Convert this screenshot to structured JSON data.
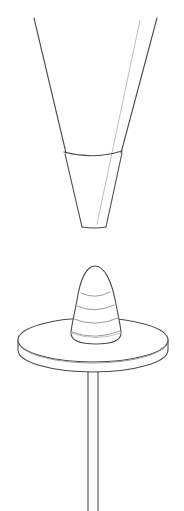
{
  "page": {
    "title": "Technical Line Drawing",
    "width": 184,
    "height": 511,
    "background_color": "#ffffff",
    "style": "monochrome outline illustration, no text labels"
  },
  "palette": {
    "background": "#ffffff",
    "outline_dark": "#4a4a4a",
    "outline_mid": "#9a9a9a",
    "outline_faint": "#c0c0c0"
  },
  "figures": [
    {
      "id": "funnel",
      "name": "open-funnel",
      "description": "Tall open funnel / conical nozzle shown from the side, open at the top and truncated flat at the bottom",
      "position": "upper half of canvas",
      "bounds": {
        "x": 33,
        "y": 17,
        "width": 125,
        "height": 212
      },
      "parts": [
        {
          "name": "left-wall",
          "from": [
            34,
            18
          ],
          "to": [
            82,
            227
          ]
        },
        {
          "name": "right-wall",
          "from": [
            157,
            18
          ],
          "to": [
            105,
            227
          ]
        },
        {
          "name": "rim-line",
          "description": "elliptical seam dividing upper cone from lower spout",
          "y": 153,
          "x_start": 64,
          "x_end": 122
        },
        {
          "name": "bottom-opening",
          "description": "flat truncated tip",
          "y": 227,
          "x_start": 82,
          "x_end": 105
        },
        {
          "name": "interior-edge",
          "description": "faint far-side wall line",
          "from": [
            140,
            20
          ],
          "to": [
            97,
            224
          ]
        }
      ]
    },
    {
      "id": "pedestal",
      "name": "cone-on-pedestal-table",
      "description": "Rounded bullet-shaped cone with ridge bands resting on a round disc table supported by a thin central stem",
      "position": "lower half of canvas",
      "bounds": {
        "x": 18,
        "y": 265,
        "width": 150,
        "height": 246
      },
      "parts": [
        {
          "name": "ridged-cone",
          "description": "beehive / bullet shaped cone with four curved ridge arcs",
          "apex": [
            95,
            266
          ],
          "base_y": 334,
          "base_x_start": 72,
          "base_x_end": 120,
          "ridge_count": 4
        },
        {
          "name": "table-top-disc",
          "description": "flat elliptical disc seen in perspective",
          "center": [
            93,
            340
          ],
          "radius_x": 75,
          "radius_y": 22,
          "thickness": 12
        },
        {
          "name": "stem",
          "description": "narrow vertical two-line post from disc underside to bottom edge",
          "x_left": 87,
          "x_right": 99,
          "y_top": 372,
          "y_bottom": 511
        }
      ]
    }
  ]
}
